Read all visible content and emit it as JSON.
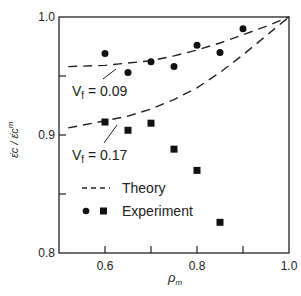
{
  "chart_data": {
    "type": "scatter",
    "title": "",
    "xlabel": "ρm",
    "ylabel": "ε̇c / ε̇c^m",
    "xlim": [
      0.5,
      1.0
    ],
    "ylim": [
      0.8,
      1.0
    ],
    "x_ticks": [
      0.5,
      0.6,
      0.7,
      0.8,
      0.9,
      1.0
    ],
    "x_tick_labels": [
      "0.6",
      "0.8",
      "1.0"
    ],
    "x_tick_label_values": [
      0.6,
      0.8,
      1.0
    ],
    "y_ticks": [
      0.8,
      0.85,
      0.9,
      0.95,
      1.0
    ],
    "y_tick_labels": [
      "0.8",
      "0.9",
      "1.0"
    ],
    "y_tick_label_values": [
      0.8,
      0.9,
      1.0
    ],
    "grid": false,
    "series": [
      {
        "name": "Theory Vf = 0.09",
        "kind": "line",
        "style": "dashed",
        "x": [
          0.52,
          0.6,
          0.7,
          0.75,
          0.8,
          0.85,
          0.9,
          0.95,
          1.0
        ],
        "y": [
          0.958,
          0.959,
          0.963,
          0.967,
          0.972,
          0.978,
          0.985,
          0.992,
          1.0
        ]
      },
      {
        "name": "Theory Vf = 0.17",
        "kind": "line",
        "style": "dashed",
        "x": [
          0.52,
          0.6,
          0.65,
          0.7,
          0.75,
          0.8,
          0.85,
          0.9,
          0.95,
          1.0
        ],
        "y": [
          0.906,
          0.912,
          0.916,
          0.922,
          0.93,
          0.94,
          0.953,
          0.968,
          0.984,
          1.0
        ]
      },
      {
        "name": "Experiment Vf = 0.09",
        "kind": "scatter",
        "marker": "circle",
        "x": [
          0.6,
          0.65,
          0.7,
          0.75,
          0.8,
          0.85,
          0.9
        ],
        "y": [
          0.969,
          0.953,
          0.962,
          0.958,
          0.976,
          0.97,
          0.99
        ]
      },
      {
        "name": "Experiment Vf = 0.17",
        "kind": "scatter",
        "marker": "square",
        "x": [
          0.6,
          0.65,
          0.7,
          0.75,
          0.8,
          0.85
        ],
        "y": [
          0.911,
          0.904,
          0.91,
          0.888,
          0.87,
          0.826
        ]
      }
    ],
    "annotations": [
      {
        "text": "Vf = 0.09",
        "x": 0.565,
        "y": 0.935
      },
      {
        "text": "Vf = 0.17",
        "x": 0.565,
        "y": 0.88
      }
    ],
    "legend": {
      "position": "inside-lower-left",
      "entries": [
        {
          "label": "Theory",
          "symbol": "dashed-line"
        },
        {
          "label": "Experiment",
          "symbol": "circle-and-square"
        }
      ]
    }
  },
  "labels": {
    "y_axis": "ε̇c / ε̇c",
    "y_axis_sup": "m",
    "x_axis": "ρ",
    "x_axis_sub": "m",
    "vf1_prefix": "V",
    "vf1_sub": "f",
    "vf1_value": " = 0.09",
    "vf2_prefix": "V",
    "vf2_sub": "f",
    "vf2_value": " = 0.17",
    "legend_theory": "Theory",
    "legend_experiment": "Experiment"
  }
}
